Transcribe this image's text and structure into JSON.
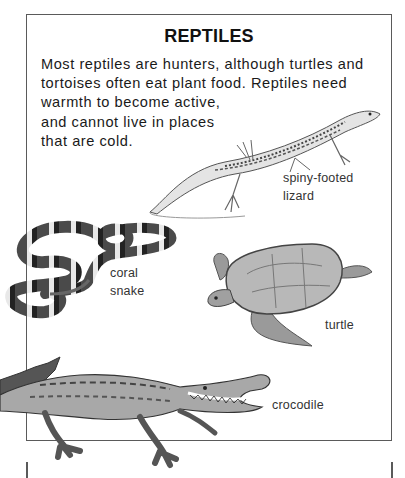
{
  "page": {
    "title": "REPTILES",
    "intro_lines": [
      "Most reptiles are hunters, although turtles and",
      "tortoises often eat plant food. Reptiles need",
      "warmth to become active,",
      "and cannot live in places",
      "that are cold."
    ]
  },
  "illustrations": [
    {
      "id": "lizard",
      "label_lines": [
        "spiny-footed",
        "lizard"
      ]
    },
    {
      "id": "snake",
      "label_lines": [
        "coral",
        "snake"
      ]
    },
    {
      "id": "turtle",
      "label_lines": [
        "turtle"
      ]
    },
    {
      "id": "crocodile",
      "label_lines": [
        "crocodile"
      ]
    }
  ],
  "colors": {
    "frame": "#5a5a5a",
    "text": "#1a1a1a",
    "illustration_dark": "#3a3a3a",
    "illustration_mid": "#8a8a8a",
    "illustration_light": "#d8d8d8"
  }
}
